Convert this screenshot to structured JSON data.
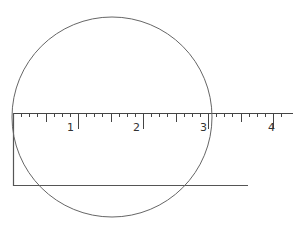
{
  "diagram": {
    "ruler": {
      "labels": [
        "1",
        "2",
        "3",
        "4"
      ],
      "origin_x": 13,
      "y": 113,
      "end_x": 293,
      "inch_px": 65,
      "subdivisions": 8
    },
    "circle": {
      "cx": 112,
      "cy": 117,
      "r": 100
    },
    "bracket": {
      "x": 13,
      "top_y": 113,
      "bottom_y": 185,
      "end_x": 248
    },
    "colors": {
      "line": "#555555",
      "circle": "#666666"
    }
  }
}
